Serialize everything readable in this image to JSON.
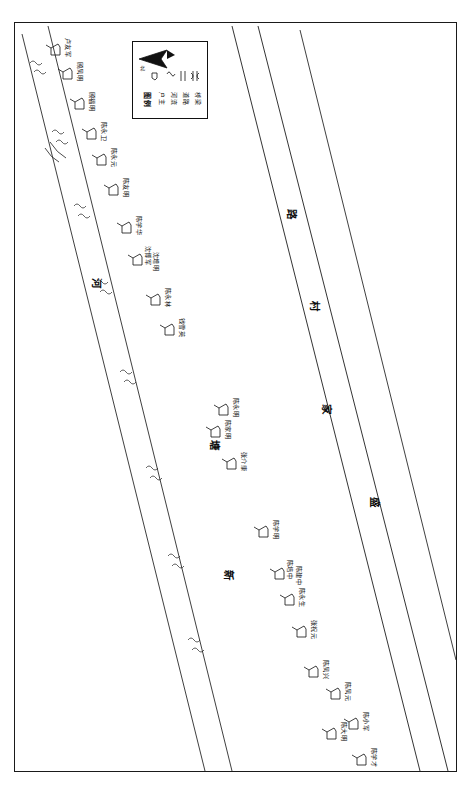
{
  "document": {
    "type": "village-household-distribution-map",
    "orientation": "landscape-content-in-portrait-frame",
    "background_color": "#ffffff",
    "ink_color": "#111111"
  },
  "legend": {
    "title": "图例",
    "north_label": "北",
    "entries": [
      {
        "label": "户主",
        "symbol": "household-marker"
      },
      {
        "label": "河流",
        "symbol": "river-line"
      },
      {
        "label": "道路",
        "symbol": "road-double-line"
      },
      {
        "label": "桥梁",
        "symbol": "bridge-mark"
      }
    ]
  },
  "features": {
    "river_label": "新塘河",
    "river_label_chars": [
      "新",
      "塘",
      "河"
    ],
    "road_label": "盛家村路",
    "road_label_chars": [
      "盛",
      "家",
      "村",
      "路"
    ]
  },
  "households": [
    {
      "name": "卢友军",
      "x": 72,
      "y": 38
    },
    {
      "name": "顾凤明",
      "x": 84,
      "y": 62
    },
    {
      "name": "顾福明",
      "x": 96,
      "y": 92
    },
    {
      "name": "陈永卫",
      "x": 108,
      "y": 122
    },
    {
      "name": "陈永元",
      "x": 118,
      "y": 148
    },
    {
      "name": "陈友明",
      "x": 130,
      "y": 178
    },
    {
      "name": "陈学华",
      "x": 143,
      "y": 216
    },
    {
      "name": "沈博军",
      "x": 152,
      "y": 246
    },
    {
      "name": "沈增明",
      "x": 160,
      "y": 252
    },
    {
      "name": "陈永林",
      "x": 172,
      "y": 288
    },
    {
      "name": "钱雪英",
      "x": 186,
      "y": 318
    },
    {
      "name": "陈永明",
      "x": 240,
      "y": 398
    },
    {
      "name": "陈家明",
      "x": 232,
      "y": 420
    },
    {
      "name": "张介康",
      "x": 248,
      "y": 452
    },
    {
      "name": "陈学明",
      "x": 280,
      "y": 520
    },
    {
      "name": "陈培中",
      "x": 294,
      "y": 560
    },
    {
      "name": "陈建中",
      "x": 303,
      "y": 566
    },
    {
      "name": "陈永生",
      "x": 306,
      "y": 588
    },
    {
      "name": "张祝元",
      "x": 318,
      "y": 620
    },
    {
      "name": "陈凤兴",
      "x": 330,
      "y": 660
    },
    {
      "name": "陈凤元",
      "x": 352,
      "y": 682
    },
    {
      "name": "陈大明",
      "x": 348,
      "y": 722
    },
    {
      "name": "陈小军",
      "x": 370,
      "y": 712
    },
    {
      "name": "陈学才",
      "x": 378,
      "y": 748
    }
  ]
}
